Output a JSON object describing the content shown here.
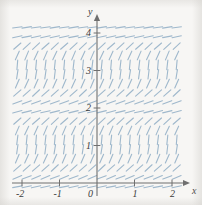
{
  "figure": {
    "background_color": "#f7f6f4",
    "width": 202,
    "height": 205
  },
  "axes": {
    "x_axis_label": "x",
    "y_axis_label": "y",
    "axis_color": "#6f6f6f",
    "x_ticks": [
      {
        "label": "-2",
        "value": -2
      },
      {
        "label": "-1",
        "value": -1
      },
      {
        "label": "0",
        "value": 0
      },
      {
        "label": "1",
        "value": 1
      },
      {
        "label": "2",
        "value": 2
      }
    ],
    "y_ticks": [
      {
        "label": "1",
        "value": 1
      },
      {
        "label": "2",
        "value": 2
      },
      {
        "label": "3",
        "value": 3
      },
      {
        "label": "4",
        "value": 4
      }
    ]
  },
  "chart_data": {
    "type": "scatter",
    "plot_kind": "slope-field",
    "title": "",
    "xlabel": "x",
    "ylabel": "y",
    "xlim": [
      -2.25,
      2.2
    ],
    "ylim": [
      -0.25,
      4.35
    ],
    "grid": false,
    "legend": null,
    "segment_color": "#9fb8cc",
    "segment_length": 9.5,
    "segment_line_width": 1.1,
    "sample_x": [
      -2.125,
      -1.875,
      -1.625,
      -1.375,
      -1.125,
      -0.875,
      -0.625,
      -0.375,
      -0.125,
      0.125,
      0.375,
      0.625,
      0.875,
      1.125,
      1.375,
      1.625,
      1.875,
      2.125
    ],
    "sample_y": [
      -0.1,
      0.15,
      0.4,
      0.65,
      0.9,
      1.15,
      1.4,
      1.65,
      1.9,
      2.15,
      2.4,
      2.65,
      2.9,
      3.15,
      3.4,
      3.65,
      3.9,
      4.15
    ],
    "slope_rule": "dy/dx depends only on y; periodic with period 2 in y; zero (horizontal) at y = 0, 2, 4 and steepest (near vertical) midway between",
    "slope_by_y": [
      {
        "y": -0.1,
        "slope_angle_deg": 12
      },
      {
        "y": 0.15,
        "slope_angle_deg": 22
      },
      {
        "y": 0.4,
        "slope_angle_deg": 42
      },
      {
        "y": 0.65,
        "slope_angle_deg": 66
      },
      {
        "y": 0.9,
        "slope_angle_deg": 82
      },
      {
        "y": 1.15,
        "slope_angle_deg": 84
      },
      {
        "y": 1.4,
        "slope_angle_deg": 66
      },
      {
        "y": 1.65,
        "slope_angle_deg": 42
      },
      {
        "y": 1.9,
        "slope_angle_deg": 14
      },
      {
        "y": 2.15,
        "slope_angle_deg": 20
      },
      {
        "y": 2.4,
        "slope_angle_deg": 42
      },
      {
        "y": 2.65,
        "slope_angle_deg": 66
      },
      {
        "y": 2.9,
        "slope_angle_deg": 82
      },
      {
        "y": 3.15,
        "slope_angle_deg": 84
      },
      {
        "y": 3.4,
        "slope_angle_deg": 66
      },
      {
        "y": 3.65,
        "slope_angle_deg": 42
      },
      {
        "y": 3.9,
        "slope_angle_deg": 12
      },
      {
        "y": 4.15,
        "slope_angle_deg": 8
      }
    ]
  }
}
